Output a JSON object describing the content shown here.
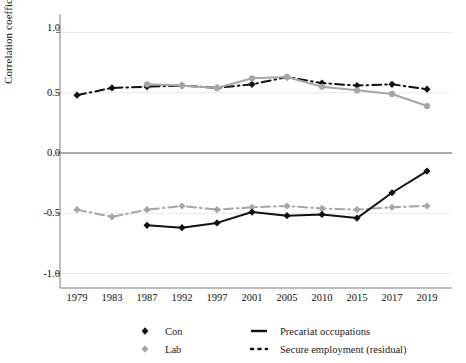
{
  "chart_data": {
    "type": "line",
    "title": "",
    "xlabel": "",
    "ylabel": "Correlation coefficient",
    "ylim": [
      -1.25,
      1.15
    ],
    "yticks": [
      "1.0",
      "0.5",
      "0.0",
      "-0.5",
      "-1.0"
    ],
    "ytick_values": [
      1.0,
      0.5,
      0.0,
      -0.5,
      -1.0
    ],
    "categories": [
      "1979",
      "1983",
      "1987",
      "1992",
      "1997",
      "2001",
      "2005",
      "2010",
      "2015",
      "2017",
      "2019"
    ],
    "grid": "horizontal-light",
    "legend_position": "bottom",
    "series": [
      {
        "name": "Con — Secure employment (residual)",
        "party": "Con",
        "measure": "Secure employment (residual)",
        "color": "#111111",
        "marker": "diamond",
        "linestyle": "dash-dot",
        "x": [
          "1979",
          "1983",
          "1987",
          "1992",
          "1997",
          "2001",
          "2005",
          "2010",
          "2015",
          "2017",
          "2019"
        ],
        "values": [
          0.48,
          0.54,
          0.55,
          0.56,
          0.54,
          0.57,
          0.63,
          0.58,
          0.56,
          0.57,
          0.53
        ]
      },
      {
        "name": "Lab — Secure employment (residual)",
        "party": "Lab",
        "measure": "Secure employment (residual)",
        "color": "#a6a6a6",
        "marker": "diamond",
        "linestyle": "dash-dot",
        "x": [
          "1979",
          "1983",
          "1987",
          "1992",
          "1997",
          "2001",
          "2005",
          "2010",
          "2015",
          "2017",
          "2019"
        ],
        "values": [
          -0.47,
          -0.53,
          -0.47,
          -0.44,
          -0.47,
          -0.45,
          -0.44,
          -0.46,
          -0.47,
          -0.45,
          -0.44
        ]
      },
      {
        "name": "Con — Precariat occupations",
        "party": "Con",
        "measure": "Precariat occupations",
        "color": "#111111",
        "marker": "diamond",
        "linestyle": "solid",
        "x": [
          "1987",
          "1992",
          "1997",
          "2001",
          "2005",
          "2010",
          "2015",
          "2017",
          "2019"
        ],
        "values": [
          -0.6,
          -0.62,
          -0.58,
          -0.49,
          -0.52,
          -0.51,
          -0.54,
          -0.33,
          -0.15
        ]
      },
      {
        "name": "Lab — Precariat occupations",
        "party": "Lab",
        "measure": "Precariat occupations",
        "color": "#a6a6a6",
        "marker": "circle",
        "linestyle": "solid",
        "x": [
          "1987",
          "1992",
          "1997",
          "2001",
          "2005",
          "2010",
          "2015",
          "2017",
          "2019"
        ],
        "values": [
          0.57,
          0.56,
          0.54,
          0.62,
          0.63,
          0.55,
          0.52,
          0.49,
          0.39
        ]
      }
    ]
  },
  "axis": {
    "ylabel": "Correlation coefficient",
    "yticks": [
      "1.0",
      "0.5",
      "0.0",
      "-0.5",
      "-1.0"
    ],
    "xticks": [
      "1979",
      "1983",
      "1987",
      "1992",
      "1997",
      "2001",
      "2005",
      "2010",
      "2015",
      "2017",
      "2019"
    ]
  },
  "legend": {
    "items": [
      {
        "label": "Con",
        "kind": "party",
        "color": "#111111"
      },
      {
        "label": "Lab",
        "kind": "party",
        "color": "#a6a6a6"
      },
      {
        "label": "Precariat occupations",
        "kind": "line",
        "style": "solid"
      },
      {
        "label": "Secure employment (residual)",
        "kind": "line",
        "style": "dotted"
      }
    ]
  },
  "colors": {
    "con": "#111111",
    "lab": "#a6a6a6",
    "grid": "#e9e9e9",
    "axis": "#7a7a7a",
    "zero_line": "#555555"
  }
}
